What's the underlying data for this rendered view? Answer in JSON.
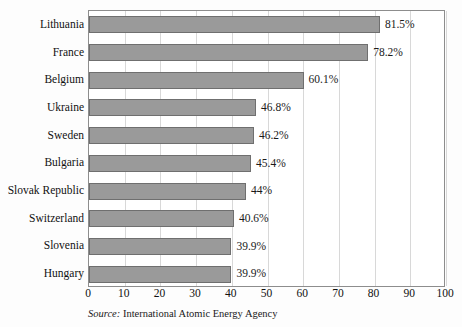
{
  "chart_data": {
    "type": "bar",
    "orientation": "horizontal",
    "title": "",
    "xlabel": "",
    "ylabel": "",
    "xlim": [
      0,
      100
    ],
    "xticks": [
      0,
      10,
      20,
      30,
      40,
      50,
      60,
      70,
      80,
      90,
      100
    ],
    "xtick_labels": [
      "0",
      "10",
      "20",
      "30",
      "40",
      "50",
      "60",
      "70",
      "80",
      "90",
      "100"
    ],
    "grid": true,
    "grid_axis": "x",
    "legend": false,
    "categories": [
      "Lithuania",
      "France",
      "Belgium",
      "Ukraine",
      "Sweden",
      "Bulgaria",
      "Slovak Republic",
      "Switzerland",
      "Slovenia",
      "Hungary"
    ],
    "values": [
      81.5,
      78.2,
      60.1,
      46.8,
      46.2,
      45.4,
      44,
      40.6,
      39.9,
      39.9
    ],
    "data_labels": [
      "81.5%",
      "78.2%",
      "60.1%",
      "46.8%",
      "46.2%",
      "45.4%",
      "44%",
      "40.6%",
      "39.9%",
      "39.9%"
    ],
    "bar_color": "#9a9a9a",
    "bar_border_color": "#6f6f6f",
    "grid_color": "#d8d8d8",
    "plot_border_color": "#8d8d8d",
    "unit": "%"
  },
  "source": {
    "lead": "Source:",
    "text": " International Atomic Energy Agency"
  }
}
